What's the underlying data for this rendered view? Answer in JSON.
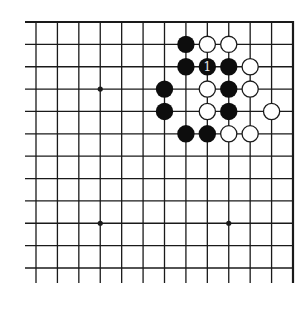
{
  "diagram": {
    "type": "go-board-diagram",
    "columns": 13,
    "rows": 12,
    "edges": {
      "top": "board-edge",
      "right": "board-edge",
      "left": "open",
      "bottom": "open"
    },
    "hoshi": [
      {
        "col": 3,
        "row": 3
      },
      {
        "col": 3,
        "row": 9
      },
      {
        "col": 9,
        "row": 9
      }
    ],
    "stones": [
      {
        "color": "black",
        "col": 7,
        "row": 1
      },
      {
        "color": "white",
        "col": 8,
        "row": 1
      },
      {
        "color": "white",
        "col": 9,
        "row": 1
      },
      {
        "color": "black",
        "col": 7,
        "row": 2
      },
      {
        "color": "black",
        "col": 8,
        "row": 2,
        "label": "1"
      },
      {
        "color": "black",
        "col": 9,
        "row": 2
      },
      {
        "color": "white",
        "col": 10,
        "row": 2
      },
      {
        "color": "black",
        "col": 6,
        "row": 3
      },
      {
        "color": "white",
        "col": 8,
        "row": 3
      },
      {
        "color": "black",
        "col": 9,
        "row": 3
      },
      {
        "color": "white",
        "col": 10,
        "row": 3
      },
      {
        "color": "black",
        "col": 6,
        "row": 4
      },
      {
        "color": "white",
        "col": 8,
        "row": 4
      },
      {
        "color": "black",
        "col": 9,
        "row": 4
      },
      {
        "color": "white",
        "col": 11,
        "row": 4
      },
      {
        "color": "black",
        "col": 7,
        "row": 5
      },
      {
        "color": "black",
        "col": 8,
        "row": 5
      },
      {
        "color": "white",
        "col": 9,
        "row": 5
      },
      {
        "color": "white",
        "col": 10,
        "row": 5
      }
    ],
    "colors": {
      "background": "#ffffff",
      "line": "#1a1a1a",
      "black_stone": "#0d0d0d",
      "white_stone_fill": "#ffffff",
      "white_stone_stroke": "#1a1a1a",
      "label_on_black": "#e8e8e8"
    }
  }
}
